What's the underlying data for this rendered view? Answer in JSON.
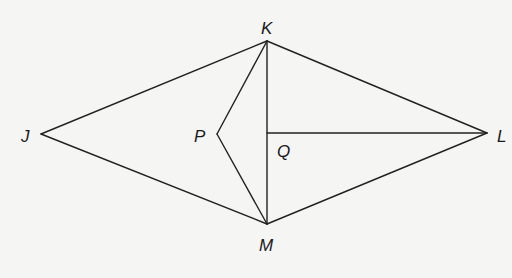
{
  "diagram": {
    "points": {
      "J": {
        "label": "J",
        "x": 41,
        "y": 134
      },
      "K": {
        "label": "K",
        "x": 267,
        "y": 41
      },
      "L": {
        "label": "L",
        "x": 487,
        "y": 133
      },
      "M": {
        "label": "M",
        "x": 267,
        "y": 224
      },
      "P": {
        "label": "P",
        "x": 217,
        "y": 134
      },
      "Q": {
        "label": "Q",
        "x": 267,
        "y": 133
      }
    },
    "segments": [
      "JK",
      "KL",
      "LM",
      "MJ",
      "KM",
      "KP",
      "PM",
      "QL"
    ],
    "labels": {
      "J": "J",
      "K": "K",
      "L": "L",
      "M": "M",
      "P": "P",
      "Q": "Q"
    },
    "line_color": "#222222",
    "background": "#f5f5f4"
  }
}
